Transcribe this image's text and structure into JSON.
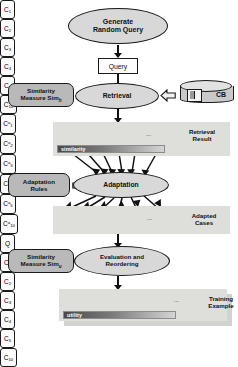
{
  "diagram": {
    "nodes": {
      "generate": "Generate\nRandom Query",
      "generate_line1": "Generate",
      "generate_line2": "Random Query",
      "query": "Query",
      "retrieval": "Retrieval",
      "adaptation": "Adaptation",
      "evaluation_line1": "Evaluation and",
      "evaluation_line2": "Reordering"
    },
    "side_boxes": {
      "similarity_top_line1": "Similarity",
      "similarity_top_line2": "Measure Sim",
      "similarity_top_sub": "h",
      "adaptation_rules_line1": "Adaptation",
      "adaptation_rules_line2": "Rules",
      "similarity_bottom_line1": "Similarity",
      "similarity_bottom_line2": "Measure Sim",
      "similarity_bottom_sub": "u"
    },
    "case_base": {
      "label": "CB",
      "icon": "database-cylinder-icon"
    },
    "bars": {
      "similarity": "similarity",
      "utility": "utility"
    },
    "panels": {
      "retrieval_result_line1": "Retrieval",
      "retrieval_result_line2": "Result",
      "adapted_cases_line1": "Adapted",
      "adapted_cases_line2": "Cases",
      "training_example_line1": "Training",
      "training_example_line2": "Example"
    },
    "rows": {
      "retrieval_result": {
        "base": "C",
        "subscripts": [
          "1",
          "2",
          "3",
          "4",
          "5"
        ],
        "ellipsis": "...",
        "last_subscript": "10",
        "superscript": ""
      },
      "adapted_cases": {
        "base": "C",
        "subscripts": [
          "1",
          "2",
          "3",
          "4",
          "5"
        ],
        "ellipsis": "...",
        "last_subscript": "10",
        "superscript": "a"
      },
      "training_example": {
        "query_label": "Q",
        "base": "C",
        "subscripts": [
          "1",
          "2",
          "3",
          "4",
          "5"
        ],
        "ellipsis": "...",
        "last_subscript": "10",
        "superscript": ""
      }
    },
    "colors": {
      "node_fill": "#d8d8d8",
      "side_box_fill": "#b9b9b9",
      "panel_fill": "#dededa",
      "stroke": "#1a1a1a",
      "bar_dark": "#4a4a4a",
      "bar_light": "#d5d5d5"
    }
  }
}
